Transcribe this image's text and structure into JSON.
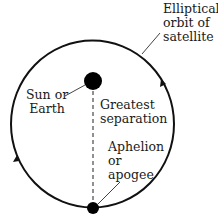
{
  "labels": {
    "orbit": [
      "Elliptical",
      "orbit of",
      "satellite"
    ],
    "body": [
      "Sun or",
      "Earth"
    ],
    "separation": [
      "Greatest",
      "separation"
    ],
    "aphelion": [
      "Aphelion",
      "or",
      "apogee"
    ]
  },
  "colors": {
    "line": "#111111",
    "background": "#ffffff"
  }
}
